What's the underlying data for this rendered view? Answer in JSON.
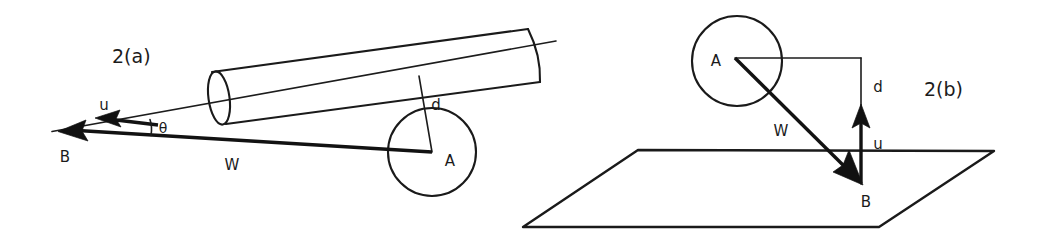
{
  "figure": {
    "background_color": "#ffffff",
    "ink_color": "#1a1a1a",
    "panels": [
      {
        "id": "panel-2a",
        "caption": "2(a)",
        "caption_position": {
          "x": 112,
          "y": 62
        },
        "description": "Side view: cylindrical tube with axis, vector W from point A to point B, component u along tube axis, perpendicular offset d, and angle theta between W and the tube axis.",
        "shapes": {
          "cylinder": {
            "name": "cylinder-tube",
            "left_end_center": {
              "x": 219,
              "y": 98
            },
            "right_end_center": {
              "x": 528,
              "y": 56
            },
            "radius_major": 27,
            "radius_minor": 11
          },
          "axis_line": {
            "name": "cylinder-axis-line",
            "from": {
              "x": 52,
              "y": 131
            },
            "to": {
              "x": 556,
              "y": 41
            }
          },
          "circle_a": {
            "name": "circle-a",
            "center": {
              "x": 432,
              "y": 152
            },
            "radius": 44
          },
          "vector_w": {
            "name": "vector-w",
            "from": {
              "x": 432,
              "y": 152
            },
            "to": {
              "x": 60,
              "y": 132
            }
          },
          "vector_u": {
            "name": "vector-u",
            "from": {
              "x": 152,
              "y": 124
            },
            "to": {
              "x": 97,
              "y": 120
            }
          },
          "segment_d": {
            "name": "segment-d",
            "from": {
              "x": 432,
              "y": 152
            },
            "to": {
              "x": 420,
              "y": 77
            }
          },
          "angle_theta_arc": {
            "name": "angle-theta-arc",
            "vertex": {
              "x": 124,
              "y": 126
            },
            "radius": 28
          }
        },
        "labels": [
          {
            "name": "label-u",
            "text": "u",
            "x": 104,
            "y": 107
          },
          {
            "name": "label-B",
            "text": "B",
            "x": 65,
            "y": 158
          },
          {
            "name": "label-theta",
            "text": "θ",
            "x": 162,
            "y": 131
          },
          {
            "name": "label-W",
            "text": "W",
            "x": 228,
            "y": 167
          },
          {
            "name": "label-d",
            "text": "d",
            "x": 433,
            "y": 106
          },
          {
            "name": "label-A",
            "text": "A",
            "x": 447,
            "y": 163
          }
        ]
      },
      {
        "id": "panel-2b",
        "caption": "2(b)",
        "caption_position": {
          "x": 924,
          "y": 95
        },
        "description": "Perspective view: sphere A above a ground plane, vector W from A down to point B on the plane, vertical component u pointing up from B, and horizontal offset d from A.",
        "shapes": {
          "circle_a": {
            "name": "circle-a",
            "center": {
              "x": 737,
              "y": 61
            },
            "radius": 45
          },
          "plane": {
            "name": "ground-plane",
            "corners": [
              {
                "x": 638,
                "y": 150
              },
              {
                "x": 994,
                "y": 151
              },
              {
                "x": 879,
                "y": 227
              },
              {
                "x": 523,
                "y": 227
              }
            ]
          },
          "horizontal_from_a": {
            "name": "segment-horizontal-from-a",
            "from": {
              "x": 735,
              "y": 58
            },
            "to": {
              "x": 861,
              "y": 58
            }
          },
          "segment_d": {
            "name": "segment-d",
            "from": {
              "x": 861,
              "y": 58
            },
            "to": {
              "x": 861,
              "y": 183
            }
          },
          "vector_w": {
            "name": "vector-w",
            "from": {
              "x": 735,
              "y": 58
            },
            "to": {
              "x": 861,
              "y": 183
            }
          },
          "vector_u": {
            "name": "vector-u",
            "from": {
              "x": 861,
              "y": 183
            },
            "to": {
              "x": 861,
              "y": 107
            }
          }
        },
        "labels": [
          {
            "name": "label-A",
            "text": "A",
            "x": 716,
            "y": 66
          },
          {
            "name": "label-d",
            "text": "d",
            "x": 876,
            "y": 88
          },
          {
            "name": "label-W",
            "text": "W",
            "x": 779,
            "y": 131
          },
          {
            "name": "label-u",
            "text": "u",
            "x": 876,
            "y": 145
          },
          {
            "name": "label-B",
            "text": "B",
            "x": 864,
            "y": 203
          }
        ]
      }
    ]
  }
}
